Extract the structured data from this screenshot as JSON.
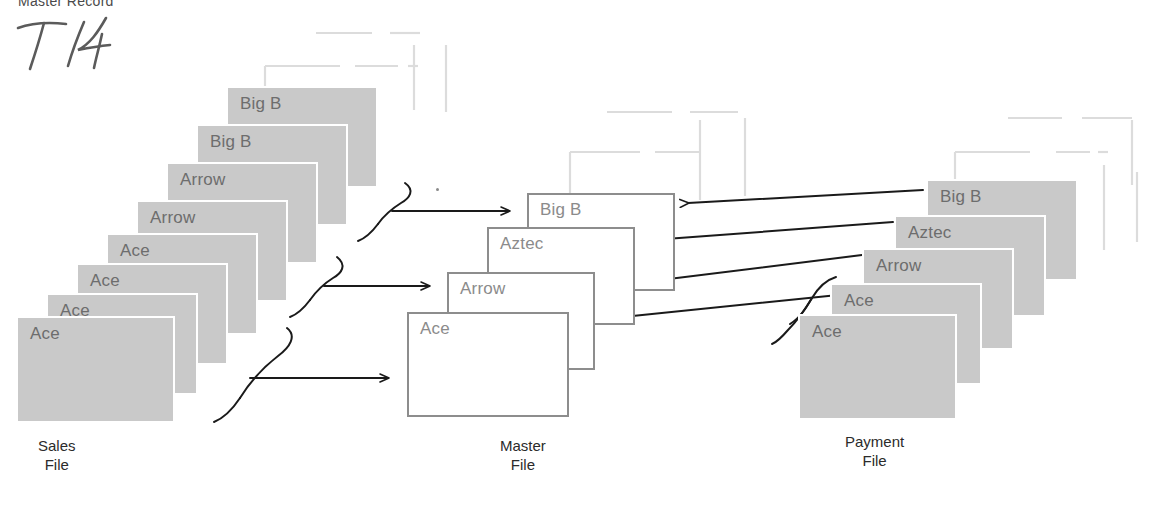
{
  "diagram": {
    "header_text": "Master Record",
    "hand_annotation": "T4",
    "stacks": [
      {
        "id": "sales-file",
        "label": "Sales\nFile",
        "label_x": 38,
        "label_y": 437,
        "style": "filled",
        "cards": [
          {
            "text": "Big B",
            "x": 228,
            "y": 88,
            "w": 148,
            "h": 98
          },
          {
            "text": "Big B",
            "x": 198,
            "y": 126,
            "w": 148,
            "h": 98
          },
          {
            "text": "Arrow",
            "x": 168,
            "y": 164,
            "w": 148,
            "h": 98
          },
          {
            "text": "Arrow",
            "x": 138,
            "y": 202,
            "w": 148,
            "h": 98
          },
          {
            "text": "Ace",
            "x": 108,
            "y": 235,
            "w": 148,
            "h": 98
          },
          {
            "text": "Ace",
            "x": 78,
            "y": 265,
            "w": 148,
            "h": 98
          },
          {
            "text": "Ace",
            "x": 48,
            "y": 295,
            "w": 148,
            "h": 98
          },
          {
            "text": "Ace",
            "x": 18,
            "y": 318,
            "w": 155,
            "h": 103
          }
        ]
      },
      {
        "id": "master-file",
        "label": "Master\nFile",
        "label_x": 500,
        "label_y": 437,
        "style": "outlined",
        "cards": [
          {
            "text": "Big B",
            "x": 527,
            "y": 193,
            "w": 148,
            "h": 98
          },
          {
            "text": "Aztec",
            "x": 487,
            "y": 227,
            "w": 148,
            "h": 98
          },
          {
            "text": "Arrow",
            "x": 447,
            "y": 272,
            "w": 148,
            "h": 98
          },
          {
            "text": "Ace",
            "x": 407,
            "y": 312,
            "w": 162,
            "h": 105
          }
        ]
      },
      {
        "id": "payment-file",
        "label": "Payment\nFile",
        "label_x": 845,
        "label_y": 433,
        "style": "filled",
        "cards": [
          {
            "text": "Big B",
            "x": 928,
            "y": 181,
            "w": 148,
            "h": 98
          },
          {
            "text": "Aztec",
            "x": 896,
            "y": 217,
            "w": 148,
            "h": 98
          },
          {
            "text": "Arrow",
            "x": 864,
            "y": 250,
            "w": 148,
            "h": 98
          },
          {
            "text": "Ace",
            "x": 832,
            "y": 285,
            "w": 148,
            "h": 98
          },
          {
            "text": "Ace",
            "x": 800,
            "y": 316,
            "w": 155,
            "h": 102
          }
        ]
      }
    ],
    "colors": {
      "card_fill": "#c9c9c9",
      "card_outline": "#8d8d8d",
      "card_text": "#6d6d6d",
      "arrow": "#1a1a1a",
      "ghost_line": "#dcdcdc",
      "label_text": "#2b2b2b"
    },
    "connectors": {
      "sales_to_master_count": 3,
      "payment_to_master_count": 4,
      "direction_sales": "left-to-right",
      "direction_payment": "right-to-left"
    }
  }
}
